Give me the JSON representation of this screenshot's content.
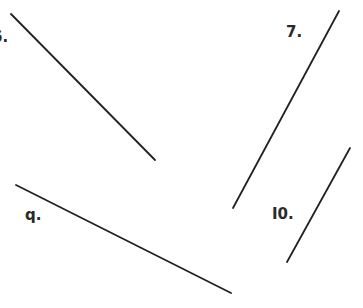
{
  "worksheet": {
    "items": [
      {
        "label": "6.",
        "x1": 11,
        "y1": 14,
        "x2": 155,
        "y2": 160,
        "label_x": -7,
        "label_y": 31
      },
      {
        "label": "7.",
        "x1": 339,
        "y1": 11,
        "x2": 233,
        "y2": 208,
        "label_x": 286,
        "label_y": 25
      },
      {
        "label": "q.",
        "x1": 16,
        "y1": 185,
        "x2": 231,
        "y2": 293,
        "label_x": 25,
        "label_y": 210
      },
      {
        "label": "I0.",
        "x1": 350,
        "y1": 148,
        "x2": 287,
        "y2": 262,
        "label_x": 272,
        "label_y": 207
      }
    ],
    "line_color": "#222222"
  }
}
